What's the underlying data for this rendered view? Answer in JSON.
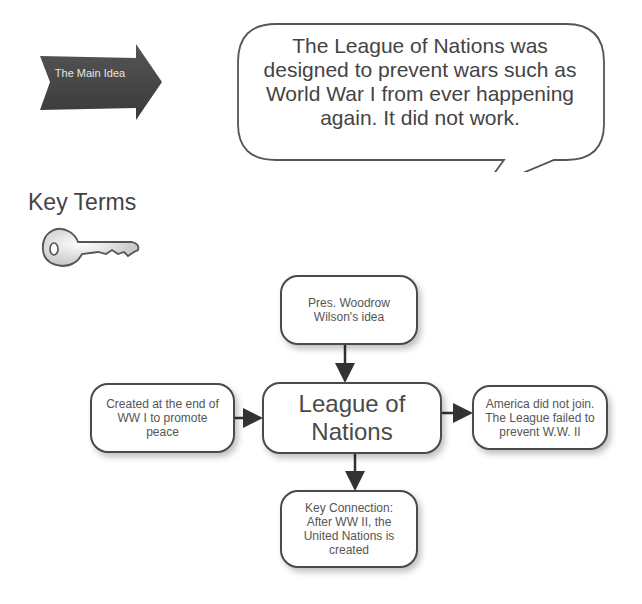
{
  "main_idea": {
    "label": "The Main Idea",
    "statement": "The League of Nations was designed to prevent wars such as World War I from ever happening again.  It did not work."
  },
  "key_terms": {
    "title": "Key Terms",
    "icon": "key-icon"
  },
  "concept_map": {
    "center": "League of Nations",
    "top": "Pres. Woodrow Wilson's idea",
    "left": "Created at the end of WW I to promote peace",
    "right": "America did not join. The League failed to prevent W.W. II",
    "bottom": "Key Connection: After WW II, the United Nations is created"
  },
  "colors": {
    "arrow_fill": "#444444",
    "border": "#4a4a4a",
    "text": "#4a4a4a",
    "background": "#ffffff"
  }
}
